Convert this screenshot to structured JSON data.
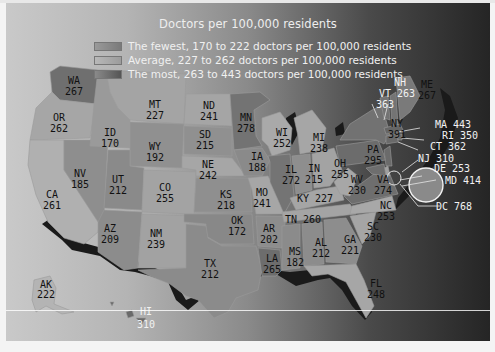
{
  "map": {
    "title": "Doctors per 100,000 residents",
    "legend": [
      {
        "label": "The fewest, 170 to 222 doctors per 100,000 residents",
        "color": "#8c8c8c"
      },
      {
        "label": "Average, 227 to 262 doctors per 100,000 residents",
        "color": "#a8a8a8"
      },
      {
        "label": "The most, 263 to 443 doctors per 100,000 residents",
        "color": "#6a6a6a"
      }
    ],
    "states": {
      "WA": {
        "abbr": "WA",
        "value": "267"
      },
      "OR": {
        "abbr": "OR",
        "value": "262"
      },
      "CA": {
        "abbr": "CA",
        "value": "261"
      },
      "NV": {
        "abbr": "NV",
        "value": "185"
      },
      "ID": {
        "abbr": "ID",
        "value": "170"
      },
      "MT": {
        "abbr": "MT",
        "value": "227"
      },
      "WY": {
        "abbr": "WY",
        "value": "192"
      },
      "UT": {
        "abbr": "UT",
        "value": "212"
      },
      "AZ": {
        "abbr": "AZ",
        "value": "209"
      },
      "CO": {
        "abbr": "CO",
        "value": "255"
      },
      "NM": {
        "abbr": "NM",
        "value": "239"
      },
      "ND": {
        "abbr": "ND",
        "value": "241"
      },
      "SD": {
        "abbr": "SD",
        "value": "215"
      },
      "NE": {
        "abbr": "NE",
        "value": "242"
      },
      "KS": {
        "abbr": "KS",
        "value": "218"
      },
      "OK": {
        "abbr": "OK",
        "value": "172"
      },
      "TX": {
        "abbr": "TX",
        "value": "212"
      },
      "MN": {
        "abbr": "MN",
        "value": "278"
      },
      "IA": {
        "abbr": "IA",
        "value": "188"
      },
      "MO": {
        "abbr": "MO",
        "value": "241"
      },
      "AR": {
        "abbr": "AR",
        "value": "202"
      },
      "LA": {
        "abbr": "LA",
        "value": "265"
      },
      "WI": {
        "abbr": "WI",
        "value": "252"
      },
      "IL": {
        "abbr": "IL",
        "value": "272"
      },
      "MI": {
        "abbr": "MI",
        "value": "238"
      },
      "IN": {
        "abbr": "IN",
        "value": "215"
      },
      "OH": {
        "abbr": "OH",
        "value": "255"
      },
      "KY": {
        "abbr": "KY",
        "value": "227"
      },
      "TN": {
        "abbr": "TN",
        "value": "260"
      },
      "MS": {
        "abbr": "MS",
        "value": "182"
      },
      "AL": {
        "abbr": "AL",
        "value": "212"
      },
      "GA": {
        "abbr": "GA",
        "value": "221"
      },
      "FL": {
        "abbr": "FL",
        "value": "248"
      },
      "SC": {
        "abbr": "SC",
        "value": "230"
      },
      "NC": {
        "abbr": "NC",
        "value": "253"
      },
      "VA": {
        "abbr": "VA",
        "value": "274"
      },
      "WV": {
        "abbr": "WV",
        "value": "230"
      },
      "PA": {
        "abbr": "PA",
        "value": "295"
      },
      "NY": {
        "abbr": "NY",
        "value": "391"
      },
      "VT": {
        "abbr": "VT",
        "value": "363"
      },
      "NH": {
        "abbr": "NH",
        "value": "263"
      },
      "ME": {
        "abbr": "ME",
        "value": "267"
      },
      "MA": {
        "abbr": "MA",
        "value": "443"
      },
      "RI": {
        "abbr": "RI",
        "value": "350"
      },
      "CT": {
        "abbr": "CT",
        "value": "362"
      },
      "NJ": {
        "abbr": "NJ",
        "value": "310"
      },
      "DE": {
        "abbr": "DE",
        "value": "253"
      },
      "MD": {
        "abbr": "MD",
        "value": "414"
      },
      "DC": {
        "abbr": "DC",
        "value": "768"
      },
      "AK": {
        "abbr": "AK",
        "value": "222"
      },
      "HI": {
        "abbr": "HI",
        "value": "310"
      }
    }
  }
}
